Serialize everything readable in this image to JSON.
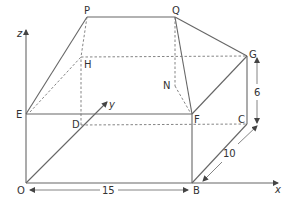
{
  "diagram": {
    "type": "3d-solid",
    "vertices": {
      "O": {
        "label": "O",
        "x": 26,
        "y": 183
      },
      "B": {
        "label": "B",
        "x": 192,
        "y": 183
      },
      "C": {
        "label": "C",
        "x": 247,
        "y": 124
      },
      "D": {
        "label": "D",
        "x": 81,
        "y": 125
      },
      "E": {
        "label": "E",
        "x": 26,
        "y": 114
      },
      "F": {
        "label": "F",
        "x": 192,
        "y": 114
      },
      "G": {
        "label": "G",
        "x": 247,
        "y": 56
      },
      "H": {
        "label": "H",
        "x": 81,
        "y": 57
      },
      "P": {
        "label": "P",
        "x": 87,
        "y": 17
      },
      "Q": {
        "label": "Q",
        "x": 175,
        "y": 17
      },
      "N": {
        "label": "N",
        "x": 175,
        "y": 86
      }
    },
    "axes": {
      "x": {
        "label": "x"
      },
      "y": {
        "label": "y"
      },
      "z": {
        "label": "z"
      }
    },
    "dimensions": {
      "length": "15",
      "width": "10",
      "height": "6"
    }
  }
}
